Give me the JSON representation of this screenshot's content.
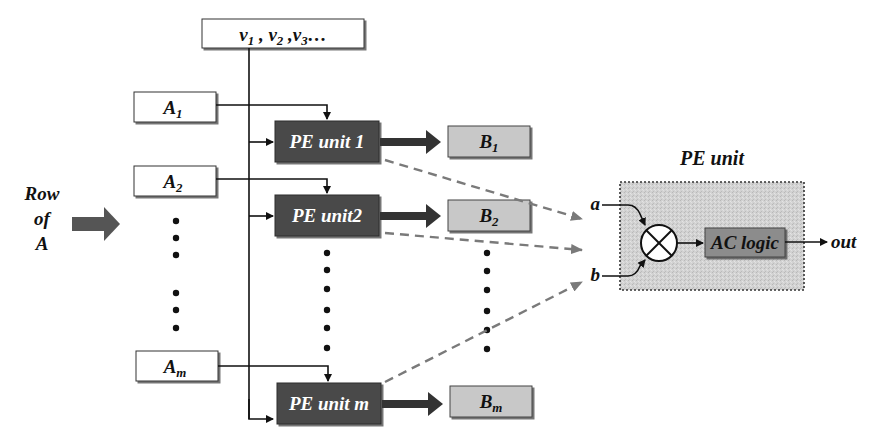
{
  "diagram": {
    "vector_input": {
      "label": "v",
      "subs": [
        "1",
        "2",
        "3"
      ],
      "text": "v1, v2, v3..."
    },
    "row_input": {
      "lines": [
        "Row",
        "of",
        "A"
      ]
    },
    "a_boxes": [
      {
        "base": "A",
        "sub": "1"
      },
      {
        "base": "A",
        "sub": "2"
      },
      {
        "base": "A",
        "sub": "m"
      }
    ],
    "pe_units": [
      {
        "label": "PE unit 1"
      },
      {
        "label": "PE unit2"
      },
      {
        "label": "PE unit m"
      }
    ],
    "b_boxes": [
      {
        "base": "B",
        "sub": "1"
      },
      {
        "base": "B",
        "sub": "2"
      },
      {
        "base": "B",
        "sub": "m"
      }
    ],
    "pe_detail": {
      "title": "PE unit",
      "input_a": "a",
      "input_b": "b",
      "multiplier_symbol": "⊗",
      "logic_label": "AC logic",
      "output": "out"
    },
    "colors": {
      "pe_fill": "#4a4a4a",
      "b_fill": "#c8c8c8",
      "detail_fill": "#cfcfcf",
      "logic_fill": "#8c8c8c",
      "dashed": "#7a7a7a",
      "arrow": "#3a3a3a"
    }
  }
}
